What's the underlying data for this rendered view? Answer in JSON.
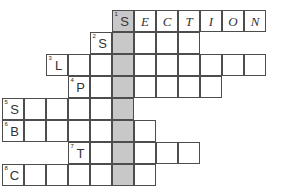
{
  "puzzle": {
    "title": "Crossword Grid",
    "cell_size": 22,
    "origin_x": 2,
    "origin_y": 10,
    "shaded_column_index": 6,
    "shaded_color": "#c8c8c8",
    "grid_line_color": "#4d4d4d",
    "background_color": "#ffffff",
    "rows": [
      {
        "index": 1,
        "start_col": 6,
        "length": 7,
        "number": "1",
        "letters": [
          "S",
          "E",
          "C",
          "T",
          "I",
          "O",
          "N"
        ]
      },
      {
        "index": 2,
        "start_col": 5,
        "length": 5,
        "number": "2",
        "letters": [
          "S",
          "",
          "",
          "",
          ""
        ]
      },
      {
        "index": 3,
        "start_col": 3,
        "length": 10,
        "number": "3",
        "letters": [
          "L",
          "",
          "",
          "",
          "",
          "",
          "",
          "",
          "",
          ""
        ]
      },
      {
        "index": 4,
        "start_col": 4,
        "length": 7,
        "number": "4",
        "letters": [
          "P",
          "",
          "",
          "",
          "",
          "",
          ""
        ]
      },
      {
        "index": 5,
        "start_col": 1,
        "length": 6,
        "number": "5",
        "letters": [
          "S",
          "",
          "",
          "",
          "",
          ""
        ]
      },
      {
        "index": 6,
        "start_col": 1,
        "length": 7,
        "number": "6",
        "letters": [
          "B",
          "",
          "",
          "",
          "",
          "",
          ""
        ]
      },
      {
        "index": 7,
        "start_col": 4,
        "length": 6,
        "number": "7",
        "letters": [
          "T",
          "",
          "",
          "",
          "",
          ""
        ]
      },
      {
        "index": 8,
        "start_col": 1,
        "length": 7,
        "number": "8",
        "letters": [
          "C",
          "",
          "",
          "",
          "",
          "",
          ""
        ]
      }
    ]
  }
}
